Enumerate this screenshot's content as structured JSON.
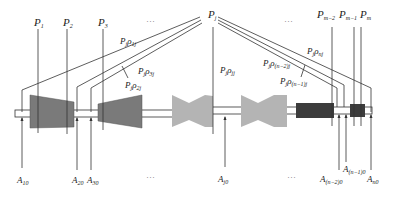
{
  "diagram": {
    "type": "multistage-shaft-load-schematic",
    "top_labels": [
      {
        "id": "P1",
        "base": "P",
        "sub": "1",
        "x": 36
      },
      {
        "id": "P2",
        "base": "P",
        "sub": "2",
        "x": 66
      },
      {
        "id": "P3",
        "base": "P",
        "sub": "3",
        "x": 101
      },
      {
        "id": "Pj",
        "base": "P",
        "sub": "j",
        "x": 213
      },
      {
        "id": "Pm-2",
        "base": "P",
        "sub": "m−2",
        "x": 330
      },
      {
        "id": "Pm-1",
        "base": "P",
        "sub": "m−1",
        "x": 353
      },
      {
        "id": "Pm",
        "base": "P",
        "sub": "m",
        "x": 361
      }
    ],
    "top_ellipses": [
      {
        "text": "···",
        "x": 150
      },
      {
        "text": "···",
        "x": 290
      }
    ],
    "rho_labels": [
      {
        "id": "rho1j",
        "base": "P",
        "sub1": "j",
        "mid": "ρ",
        "sub2": "1j"
      },
      {
        "id": "rho3j",
        "base": "P",
        "sub1": "j",
        "mid": "ρ",
        "sub2": "3j"
      },
      {
        "id": "rho2j",
        "base": "P",
        "sub1": "j",
        "mid": "ρ",
        "sub2": "2j"
      },
      {
        "id": "rhojj",
        "base": "P",
        "sub1": "j",
        "mid": "ρ",
        "sub2": "jj"
      },
      {
        "id": "rho_n-2",
        "base": "P",
        "sub1": "j",
        "mid": "ρ",
        "sub2": "(n−2)j"
      },
      {
        "id": "rho_n-1",
        "base": "P",
        "sub1": "j",
        "mid": "ρ",
        "sub2": "(n−1)j"
      },
      {
        "id": "rho_n",
        "base": "P",
        "sub1": "j",
        "mid": "ρ",
        "sub2": "nj"
      }
    ],
    "bottom_labels": [
      {
        "id": "A10",
        "base": "A",
        "sub": "10"
      },
      {
        "id": "A20",
        "base": "A",
        "sub": "20"
      },
      {
        "id": "A30",
        "base": "A",
        "sub": "30"
      },
      {
        "id": "Aj0",
        "base": "A",
        "sub": "j0"
      },
      {
        "id": "A(n-2)0",
        "base": "A",
        "sub": "(n−2)0"
      },
      {
        "id": "A(n-1)0",
        "base": "A",
        "sub": "(n−1)0"
      },
      {
        "id": "An0",
        "base": "A",
        "sub": "n0"
      }
    ],
    "bottom_ellipses": [
      {
        "text": "···"
      },
      {
        "text": "···"
      }
    ],
    "components": [
      {
        "name": "stage-1-tapered",
        "shape": "trapezoid",
        "color": "#7a7a7a"
      },
      {
        "name": "stage-2-tapered",
        "shape": "trapezoid",
        "color": "#7a7a7a"
      },
      {
        "name": "stage-bowtie-1",
        "shape": "bowtie",
        "color": "#b4b4b4"
      },
      {
        "name": "stage-bowtie-2",
        "shape": "bowtie",
        "color": "#b4b4b4"
      },
      {
        "name": "block-large",
        "shape": "rect",
        "color": "#3c3c3c"
      },
      {
        "name": "block-small",
        "shape": "rect",
        "color": "#3c3c3c"
      }
    ],
    "colors": {
      "line": "#333333",
      "shaft_fill": "#ffffff",
      "dark_trapezoid": "#7a7a7a",
      "light_bowtie": "#b4b4b4",
      "dark_block": "#3c3c3c"
    }
  }
}
